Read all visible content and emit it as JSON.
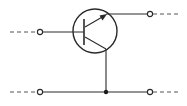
{
  "diagram": {
    "title": "NPN transistor common-collector (emitter follower) circuit",
    "component": "npn-transistor",
    "colors": {
      "line": "#2a2a2a",
      "background": "#ffffff"
    },
    "transistor": {
      "center": [
        95,
        31
      ],
      "radius": 22,
      "base_bar": {
        "x": 84,
        "y1": 19,
        "y2": 45
      },
      "emitter": {
        "from": [
          85,
          26
        ],
        "to": [
          107,
          14
        ],
        "arrow": "outward"
      },
      "collector": {
        "from": [
          85,
          37
        ],
        "to": [
          106,
          49
        ]
      }
    },
    "terminals": [
      {
        "id": "input-base",
        "x": 40,
        "y": 32
      },
      {
        "id": "output-emitter",
        "x": 150,
        "y": 14
      },
      {
        "id": "input-common",
        "x": 40,
        "y": 92
      },
      {
        "id": "output-common",
        "x": 150,
        "y": 92
      }
    ],
    "junctions": [
      {
        "id": "collector-ground-junction",
        "x": 106,
        "y": 92
      }
    ],
    "wires": [
      {
        "id": "base-lead",
        "points": [
          [
            43,
            32
          ],
          [
            73,
            32
          ]
        ]
      },
      {
        "id": "base-stub",
        "points": [
          [
            73,
            32
          ],
          [
            84,
            32
          ]
        ]
      },
      {
        "id": "emitter-lead",
        "points": [
          [
            107,
            14
          ],
          [
            147,
            14
          ]
        ]
      },
      {
        "id": "collector-lead",
        "points": [
          [
            106,
            49
          ],
          [
            106,
            92
          ]
        ]
      },
      {
        "id": "common-rail",
        "points": [
          [
            43,
            92
          ],
          [
            147,
            92
          ]
        ]
      }
    ],
    "dashed_leads": [
      {
        "id": "base-input-dash",
        "points": [
          [
            10,
            32
          ],
          [
            37,
            32
          ]
        ]
      },
      {
        "id": "emitter-output-dash",
        "points": [
          [
            153,
            14
          ],
          [
            181,
            14
          ]
        ]
      },
      {
        "id": "common-input-dash",
        "points": [
          [
            10,
            92
          ],
          [
            37,
            92
          ]
        ]
      },
      {
        "id": "common-output-dash",
        "points": [
          [
            153,
            92
          ],
          [
            181,
            92
          ]
        ]
      }
    ]
  }
}
